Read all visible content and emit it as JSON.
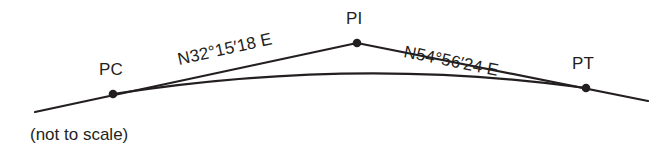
{
  "diagram": {
    "caption": "(not to scale)",
    "line_color": "#231f20",
    "text_color": "#231f20",
    "background_color": "#ffffff",
    "points": [
      {
        "id": "PC",
        "label": "PC",
        "x": 113,
        "y": 94
      },
      {
        "id": "PI",
        "label": "PI",
        "x": 357,
        "y": 43
      },
      {
        "id": "PT",
        "label": "PT",
        "x": 586,
        "y": 88
      }
    ],
    "bearings": [
      {
        "id": "back-tangent",
        "label": "N32°15′18 E",
        "from": "PC",
        "to": "PI"
      },
      {
        "id": "ahead-tangent",
        "label": "N54°56′24 E",
        "from": "PI",
        "to": "PT"
      }
    ],
    "tangent_back": {
      "x1": 35,
      "y1": 112,
      "x2": 357,
      "y2": 43
    },
    "tangent_ahead": {
      "x1": 357,
      "y1": 43,
      "x2": 648,
      "y2": 101
    },
    "curve": {
      "start_x": 113,
      "start_y": 94,
      "ctrl_x": 357,
      "ctrl_y": 56,
      "end_x": 586,
      "end_y": 88
    }
  }
}
